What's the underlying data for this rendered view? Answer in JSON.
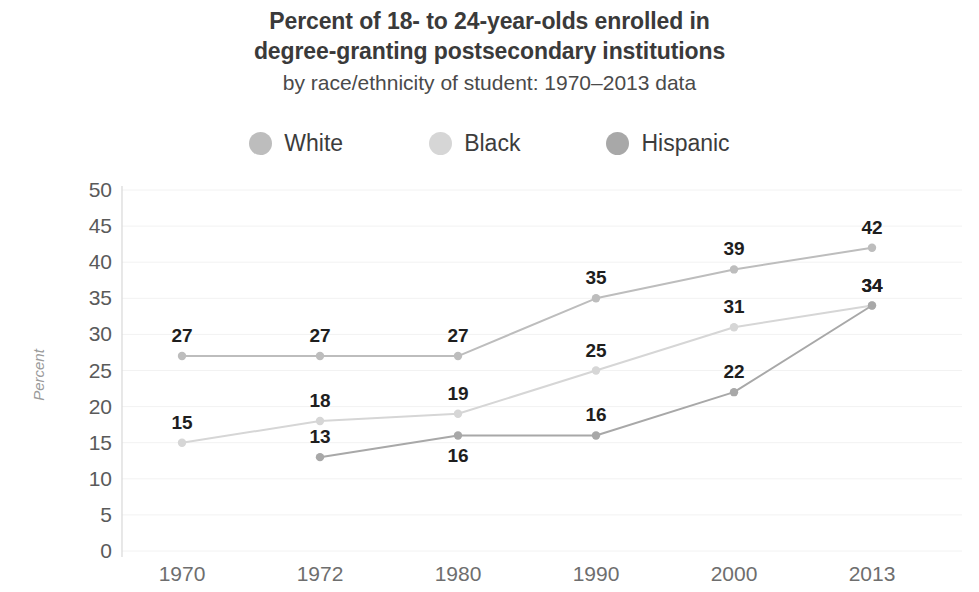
{
  "title": {
    "line1": "Percent of 18- to 24-year-olds enrolled in",
    "line2": "degree-granting postsecondary institutions",
    "subtitle": "by race/ethnicity of student: 1970–2013 data"
  },
  "legend": {
    "position": "top",
    "items": [
      {
        "label": "White",
        "color": "#bdbdbd"
      },
      {
        "label": "Black",
        "color": "#d6d6d6"
      },
      {
        "label": "Hispanic",
        "color": "#a8a8a8"
      }
    ]
  },
  "chart_data": {
    "type": "line",
    "title": "Percent of 18- to 24-year-olds enrolled in degree-granting postsecondary institutions by race/ethnicity of student: 1970–2013 data",
    "xlabel": "",
    "ylabel": "Percent",
    "categories": [
      "1970",
      "1972",
      "1980",
      "1990",
      "2000",
      "2013"
    ],
    "yticks": [
      0,
      5,
      10,
      15,
      20,
      25,
      30,
      35,
      40,
      45,
      50
    ],
    "ylim": [
      0,
      50
    ],
    "grid": true,
    "legend_position": "top",
    "series": [
      {
        "name": "White",
        "color": "#bdbdbd",
        "values": [
          27,
          27,
          27,
          35,
          39,
          42
        ],
        "labels": [
          "27",
          "27",
          "27",
          "35",
          "39",
          "42"
        ],
        "label_side": [
          "above",
          "above",
          "above",
          "above",
          "above",
          "above"
        ]
      },
      {
        "name": "Black",
        "color": "#d6d6d6",
        "values": [
          15,
          18,
          19,
          25,
          31,
          34
        ],
        "labels": [
          "15",
          "18",
          "19",
          "25",
          "31",
          "34"
        ],
        "label_side": [
          "above",
          "above",
          "above",
          "above",
          "above",
          "above"
        ]
      },
      {
        "name": "Hispanic",
        "color": "#a8a8a8",
        "values": [
          null,
          13,
          16,
          16,
          22,
          34
        ],
        "labels": [
          null,
          "13",
          "16",
          "16",
          "22",
          null
        ],
        "label_side": [
          null,
          "above",
          "below",
          "above",
          "above",
          null
        ]
      }
    ]
  },
  "axis": {
    "y_title": "Percent"
  }
}
